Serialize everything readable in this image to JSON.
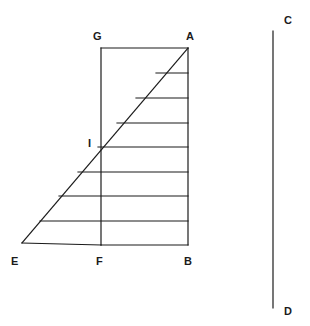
{
  "figure": {
    "background_color": "#ffffff",
    "stroke_color": "#1b1b1b",
    "label_color": "#1b1b1b",
    "stroke_width": 1.2,
    "canvas": {
      "width": 310,
      "height": 326
    }
  },
  "points": {
    "A": {
      "label": "A",
      "x": 188,
      "y": 48,
      "label_x": 186,
      "label_y": 31
    },
    "B": {
      "label": "B",
      "x": 188,
      "y": 245,
      "label_x": 184,
      "label_y": 256
    },
    "C": {
      "label": "C",
      "x": 273,
      "y": 31,
      "label_x": 284,
      "label_y": 15
    },
    "D": {
      "label": "D",
      "x": 273,
      "y": 308,
      "label_x": 284,
      "label_y": 306
    },
    "E": {
      "label": "E",
      "x": 22,
      "y": 243,
      "label_x": 11,
      "label_y": 256
    },
    "F": {
      "label": "F",
      "x": 101,
      "y": 245,
      "label_x": 96,
      "label_y": 256
    },
    "G": {
      "label": "G",
      "x": 101,
      "y": 48,
      "label_x": 93,
      "label_y": 31
    },
    "I": {
      "label": "I",
      "x": 101,
      "y": 147,
      "label_x": 88,
      "label_y": 138
    }
  },
  "segments": [
    {
      "name": "top-edge-GA",
      "from": "G",
      "to": "A"
    },
    {
      "name": "right-edge-AB",
      "from": "A",
      "to": "B"
    },
    {
      "name": "bottom-edge-FB",
      "from": "F",
      "to": "B"
    },
    {
      "name": "left-edge-GF",
      "from": "G",
      "to": "F"
    },
    {
      "name": "diagonal-EA",
      "from": "E",
      "to": "A"
    },
    {
      "name": "baseline-EF",
      "from": "E",
      "to": "F"
    },
    {
      "name": "vertical-CD",
      "from": "C",
      "to": "D"
    }
  ],
  "hatch_lines": [
    {
      "name": "hatch-1",
      "y": 73,
      "x_left": 156,
      "x_right": 188
    },
    {
      "name": "hatch-2",
      "y": 98,
      "x_left": 136,
      "x_right": 188
    },
    {
      "name": "hatch-3",
      "y": 123,
      "x_left": 117,
      "x_right": 188
    },
    {
      "name": "hatch-4",
      "y": 147,
      "x_left": 98,
      "x_right": 188
    },
    {
      "name": "hatch-5",
      "y": 172,
      "x_left": 78,
      "x_right": 188
    },
    {
      "name": "hatch-6",
      "y": 196,
      "x_left": 59,
      "x_right": 188
    },
    {
      "name": "hatch-7",
      "y": 221,
      "x_left": 40,
      "x_right": 188
    }
  ],
  "chart_data": {
    "type": "diagram",
    "labels": [
      "A",
      "B",
      "C",
      "D",
      "E",
      "F",
      "G",
      "I"
    ],
    "band_count": 8,
    "rectangle": {
      "left": 101,
      "top": 48,
      "right": 188,
      "bottom": 245
    },
    "diagonal_endpoints": [
      [
        22,
        243
      ],
      [
        188,
        48
      ]
    ],
    "separate_vertical_segment": [
      [
        273,
        31
      ],
      [
        273,
        308
      ]
    ]
  }
}
